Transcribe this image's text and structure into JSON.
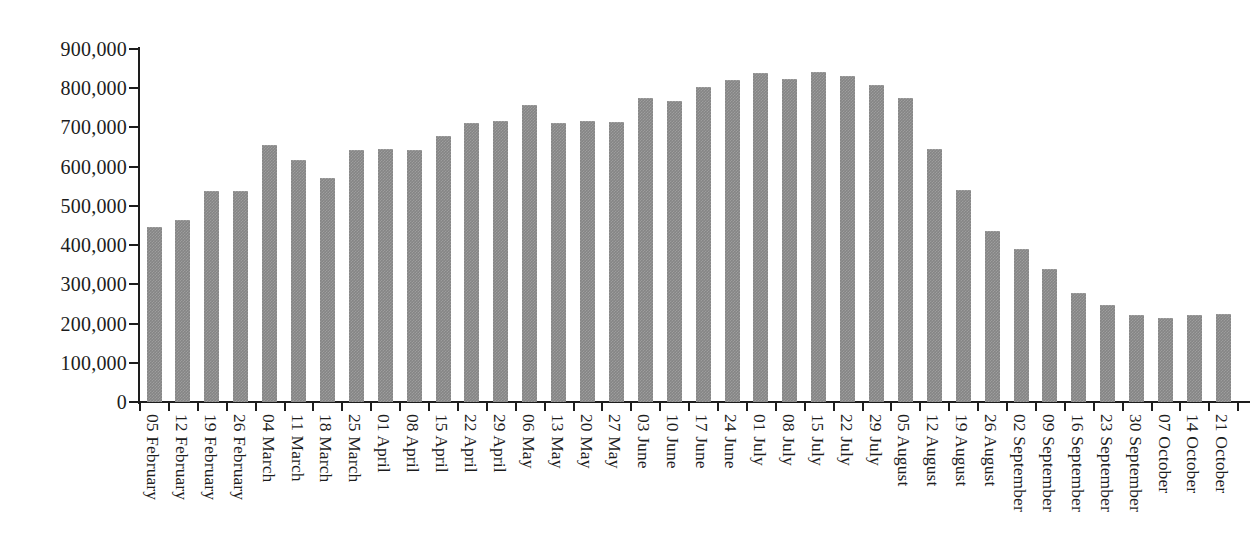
{
  "chart_data": {
    "type": "bar",
    "title": "",
    "subtitle": "",
    "xlabel": "",
    "ylabel": "",
    "ylim": [
      0,
      900000
    ],
    "ytick_step": 100000,
    "grid": false,
    "legend": null,
    "bar_color": "#858585",
    "axis_color": "#1d1d1d",
    "ytick_labels": [
      "900,000",
      "800,000",
      "700,000",
      "600,000",
      "500,000",
      "400,000",
      "300,000",
      "200,000",
      "100,000",
      "0"
    ],
    "ytick_values": [
      900000,
      800000,
      700000,
      600000,
      500000,
      400000,
      300000,
      200000,
      100000,
      0
    ],
    "categories": [
      "05 February",
      "12 February",
      "19 February",
      "26 February",
      "04 March",
      "11 March",
      "18 March",
      "25 March",
      "01 April",
      "08 April",
      "15 April",
      "22 April",
      "29 April",
      "06 May",
      "13 May",
      "20 May",
      "27 May",
      "03 June",
      "10 June",
      "17 June",
      "24 June",
      "01 July",
      "08 July",
      "15 July",
      "22 July",
      "29 July",
      "05 August",
      "12 August",
      "19 August",
      "26 August",
      "02 September",
      "09 September",
      "16 September",
      "23 September",
      "30 September",
      "07 October",
      "14 October",
      "21 October"
    ],
    "values": [
      445000,
      463000,
      538000,
      538000,
      655000,
      617000,
      570000,
      642000,
      645000,
      642000,
      678000,
      711000,
      717000,
      758000,
      712000,
      717000,
      713000,
      775000,
      768000,
      803000,
      822000,
      840000,
      823000,
      841000,
      832000,
      809000,
      774000,
      645000,
      541000,
      437000,
      389000,
      340000,
      279000,
      248000,
      221000,
      215000,
      222000,
      225000
    ]
  }
}
